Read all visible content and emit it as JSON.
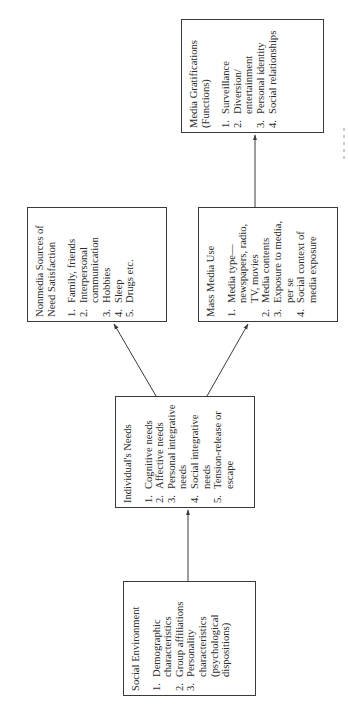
{
  "diagram": {
    "orientation": "rotated-90-ccw",
    "colors": {
      "line": "#3a3a3a",
      "text": "#2b2b2b",
      "background": "#ffffff"
    },
    "boxes": {
      "social_environment": {
        "title": "Social Environment",
        "items": [
          {
            "num": "1.",
            "text": "Demographic characteristics"
          },
          {
            "num": "2.",
            "text": "Group affiliations"
          },
          {
            "num": "3.",
            "text": "Personality characteristics (psychological dispositions)"
          }
        ]
      },
      "individual_needs": {
        "title": "Individual's Needs",
        "items": [
          {
            "num": "1.",
            "text": "Cognitive needs"
          },
          {
            "num": "2.",
            "text": "Affective needs"
          },
          {
            "num": "3.",
            "text": "Personal integrative needs"
          },
          {
            "num": "4.",
            "text": "Social integrative needs"
          },
          {
            "num": "5.",
            "text": "Tension-release or escape"
          }
        ]
      },
      "nonmedia_sources": {
        "title": "Nonmedia Sources of Need Satisfaction",
        "items": [
          {
            "num": "1.",
            "text": "Family, friends"
          },
          {
            "num": "2.",
            "text": "Interpersonal communication"
          },
          {
            "num": "3.",
            "text": "Hobbies"
          },
          {
            "num": "4.",
            "text": "Sleep"
          },
          {
            "num": "5.",
            "text": "Drugs etc."
          }
        ]
      },
      "mass_media_use": {
        "title": "Mass Media Use",
        "items": [
          {
            "num": "1.",
            "text": "Media type—newspapers, radio, TV, movies"
          },
          {
            "num": "2.",
            "text": "Media contents"
          },
          {
            "num": "3.",
            "text": "Exposure to media, per se"
          },
          {
            "num": "4.",
            "text": "Social context of media exposure"
          }
        ]
      },
      "media_gratifications": {
        "title": "Media Gratifications (Functions)",
        "items": [
          {
            "num": "1.",
            "text": "Surveillance"
          },
          {
            "num": "2.",
            "text": "Diversion/ entertainment"
          },
          {
            "num": "3.",
            "text": "Personal identity"
          },
          {
            "num": "4.",
            "text": "Social relationships"
          }
        ]
      }
    },
    "edges": [
      {
        "from": "Social Environment",
        "to": "Individual's Needs"
      },
      {
        "from": "Individual's Needs",
        "to": "Nonmedia Sources of Need Satisfaction"
      },
      {
        "from": "Individual's Needs",
        "to": "Mass Media Use"
      },
      {
        "from": "Mass Media Use",
        "to": "Media Gratifications (Functions)"
      }
    ]
  }
}
